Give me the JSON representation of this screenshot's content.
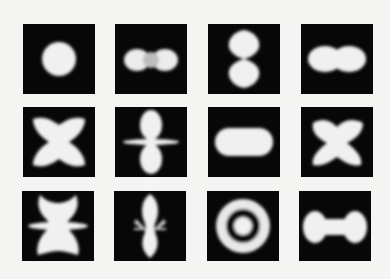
{
  "figure": {
    "background": "#f4f4f2",
    "panel_color": "#070707",
    "shape_color": "#f0f0f0",
    "rows": 3,
    "columns": 4,
    "panels": [
      {
        "row": 1,
        "col": 1,
        "shape": "sphere"
      },
      {
        "row": 1,
        "col": 2,
        "shape": "horizontal-double-lobe"
      },
      {
        "row": 1,
        "col": 3,
        "shape": "vertical-double-lobe"
      },
      {
        "row": 1,
        "col": 4,
        "shape": "horizontal-peanut"
      },
      {
        "row": 2,
        "col": 1,
        "shape": "four-lobe-butterfly"
      },
      {
        "row": 2,
        "col": 2,
        "shape": "vertical-lobes-with-ring"
      },
      {
        "row": 2,
        "col": 3,
        "shape": "horizontal-ellipse"
      },
      {
        "row": 2,
        "col": 4,
        "shape": "four-lobe-butterfly"
      },
      {
        "row": 3,
        "col": 1,
        "shape": "complex-multi-lobe"
      },
      {
        "row": 3,
        "col": 2,
        "shape": "vertical-lobes-with-spikes"
      },
      {
        "row": 3,
        "col": 3,
        "shape": "ring-with-center-dot"
      },
      {
        "row": 3,
        "col": 4,
        "shape": "dumbbell"
      }
    ]
  }
}
